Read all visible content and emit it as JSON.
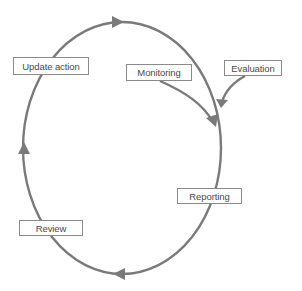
{
  "diagram": {
    "type": "cycle",
    "direction": "clockwise",
    "colors": {
      "line": "#7a7a7a",
      "box_border": "#8a8a8a",
      "text": "#4a4a4a",
      "background": "#ffffff"
    },
    "nodes": [
      {
        "id": "update_action",
        "label": "Update action"
      },
      {
        "id": "monitoring",
        "label": "Monitoring"
      },
      {
        "id": "evaluation",
        "label": "Evaluation"
      },
      {
        "id": "reporting",
        "label": "Reporting"
      },
      {
        "id": "review",
        "label": "Review"
      }
    ],
    "inputs_into_cycle": [
      "Monitoring",
      "Evaluation"
    ]
  }
}
